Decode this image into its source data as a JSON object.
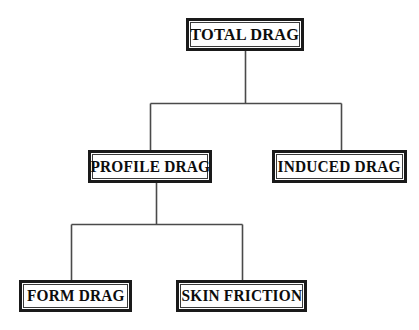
{
  "diagram": {
    "type": "hierarchy-tree",
    "background_color": "#ffffff",
    "box_border_color": "#1a1a1a",
    "connector_color": "#4a4a4a",
    "text_color": "#0d0d0d",
    "nodes": [
      {
        "id": "total-drag",
        "label": "TOTAL DRAG",
        "level": 0,
        "x": 186,
        "y": 18,
        "w": 118,
        "h": 33,
        "font_size": 17
      },
      {
        "id": "profile-drag",
        "label": "PROFILE DRAG",
        "level": 1,
        "x": 88,
        "y": 150,
        "w": 124,
        "h": 33,
        "font_size": 16
      },
      {
        "id": "induced-drag",
        "label": "INDUCED DRAG",
        "level": 1,
        "x": 272,
        "y": 150,
        "w": 135,
        "h": 33,
        "font_size": 16
      },
      {
        "id": "form-drag",
        "label": "FORM DRAG",
        "level": 2,
        "x": 19,
        "y": 280,
        "w": 113,
        "h": 32,
        "font_size": 16
      },
      {
        "id": "skin-friction",
        "label": "SKIN FRICTION",
        "level": 2,
        "x": 176,
        "y": 280,
        "w": 131,
        "h": 32,
        "font_size": 16
      }
    ],
    "edges": [
      {
        "id": "edge-total-to-profile",
        "from": "total-drag",
        "to": "profile-drag"
      },
      {
        "id": "edge-total-to-induced",
        "from": "total-drag",
        "to": "induced-drag"
      },
      {
        "id": "edge-profile-to-form",
        "from": "profile-drag",
        "to": "form-drag"
      },
      {
        "id": "edge-profile-to-skin",
        "from": "profile-drag",
        "to": "skin-friction"
      }
    ]
  }
}
